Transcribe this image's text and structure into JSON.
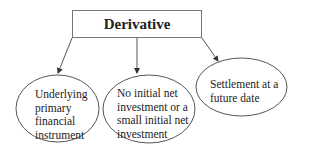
{
  "root": {
    "label": "Derivative"
  },
  "nodes": [
    {
      "label": "Underlying primary financial instrument",
      "lines": [
        "Underlying",
        "primary",
        "financial",
        "instrument"
      ]
    },
    {
      "label": "No initial net investment or a small initial net investment",
      "lines": [
        "No initial net",
        "investment or a",
        "small initial net",
        "investment"
      ]
    },
    {
      "label": "Settlement at a future date",
      "lines": [
        "Settlement at a",
        "future date"
      ]
    }
  ],
  "colors": {
    "stroke": "#555555",
    "text": "#222222"
  }
}
